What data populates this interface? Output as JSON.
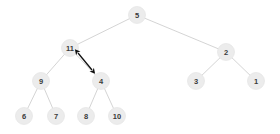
{
  "diagram": {
    "type": "binary-tree",
    "colors": {
      "background": "#ffffff",
      "node_fill": "#ececec",
      "node_stroke": "#e4e4e4",
      "node_text": "#3a3a3a",
      "edge": "#c9c9c9",
      "arrow": "#111111"
    },
    "geometry": {
      "node_radius": 8.5,
      "edge_width": 0.8,
      "arrow_width": 1.3
    },
    "nodes": [
      {
        "id": "n5",
        "label": "5",
        "cx": 137,
        "cy": 15,
        "level": 0
      },
      {
        "id": "n11",
        "label": "11",
        "cx": 70,
        "cy": 48,
        "level": 1
      },
      {
        "id": "n2",
        "label": "2",
        "cx": 226,
        "cy": 52,
        "level": 1
      },
      {
        "id": "n9",
        "label": "9",
        "cx": 41,
        "cy": 81,
        "level": 2
      },
      {
        "id": "n4",
        "label": "4",
        "cx": 101,
        "cy": 81,
        "level": 2
      },
      {
        "id": "n3",
        "label": "3",
        "cx": 196,
        "cy": 81,
        "level": 2
      },
      {
        "id": "n1",
        "label": "1",
        "cx": 256,
        "cy": 81,
        "level": 2
      },
      {
        "id": "n6",
        "label": "6",
        "cx": 24,
        "cy": 116,
        "level": 3
      },
      {
        "id": "n7",
        "label": "7",
        "cx": 56,
        "cy": 116,
        "level": 3
      },
      {
        "id": "n8",
        "label": "8",
        "cx": 86,
        "cy": 116,
        "level": 3
      },
      {
        "id": "n10",
        "label": "10",
        "cx": 117,
        "cy": 116,
        "level": 3
      }
    ],
    "edges": [
      {
        "from": "n5",
        "to": "n11"
      },
      {
        "from": "n5",
        "to": "n2"
      },
      {
        "from": "n11",
        "to": "n9"
      },
      {
        "from": "n11",
        "to": "n4"
      },
      {
        "from": "n2",
        "to": "n3"
      },
      {
        "from": "n2",
        "to": "n1"
      },
      {
        "from": "n9",
        "to": "n6"
      },
      {
        "from": "n9",
        "to": "n7"
      },
      {
        "from": "n4",
        "to": "n8"
      },
      {
        "from": "n4",
        "to": "n10"
      }
    ],
    "annotations": [
      {
        "id": "swap-arrow",
        "name": "swap-double-arrow",
        "kind": "double-headed-arrow",
        "x1": 78,
        "y1": 53,
        "x2": 92,
        "y2": 70
      }
    ]
  }
}
